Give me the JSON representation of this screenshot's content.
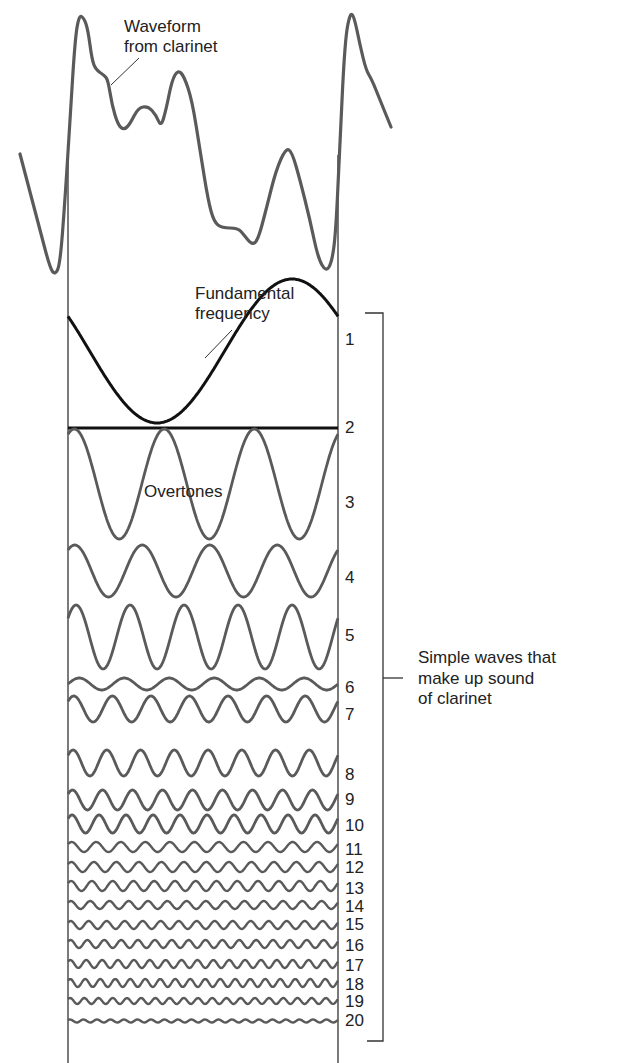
{
  "labels": {
    "waveform": [
      "Waveform",
      "from clarinet"
    ],
    "fundamental": [
      "Fundamental",
      "frequency"
    ],
    "overtones": "Overtones",
    "bracket": [
      "Simple waves that",
      "make up sound",
      "of clarinet"
    ]
  },
  "colors": {
    "wave": "#5a5a5a",
    "fundamental": "#111111",
    "frame": "#333333",
    "text": "#222222"
  },
  "frame": {
    "left_x": 68,
    "right_x": 338,
    "top_y": 155,
    "bottom_y": 1063
  },
  "bracket": {
    "x": 383,
    "top_y": 313,
    "bottom_y": 1041,
    "tick_y": 678
  },
  "waveform_points": [
    [
      20,
      154
    ],
    [
      40,
      230
    ],
    [
      50,
      268
    ],
    [
      55,
      275
    ],
    [
      60,
      265
    ],
    [
      65,
      200
    ],
    [
      70,
      120
    ],
    [
      75,
      40
    ],
    [
      79,
      15
    ],
    [
      84,
      18
    ],
    [
      88,
      30
    ],
    [
      92,
      60
    ],
    [
      96,
      70
    ],
    [
      104,
      75
    ],
    [
      108,
      80
    ],
    [
      112,
      105
    ],
    [
      118,
      125
    ],
    [
      124,
      130
    ],
    [
      130,
      124
    ],
    [
      138,
      108
    ],
    [
      148,
      106
    ],
    [
      156,
      115
    ],
    [
      161,
      127
    ],
    [
      166,
      110
    ],
    [
      172,
      80
    ],
    [
      178,
      70
    ],
    [
      184,
      76
    ],
    [
      192,
      100
    ],
    [
      200,
      150
    ],
    [
      208,
      200
    ],
    [
      214,
      222
    ],
    [
      222,
      228
    ],
    [
      238,
      228
    ],
    [
      244,
      235
    ],
    [
      252,
      245
    ],
    [
      258,
      240
    ],
    [
      266,
      210
    ],
    [
      276,
      170
    ],
    [
      286,
      148
    ],
    [
      292,
      152
    ],
    [
      300,
      180
    ],
    [
      310,
      220
    ],
    [
      318,
      258
    ],
    [
      326,
      272
    ],
    [
      332,
      262
    ],
    [
      336,
      230
    ],
    [
      340,
      140
    ],
    [
      345,
      40
    ],
    [
      350,
      13
    ],
    [
      354,
      16
    ],
    [
      360,
      45
    ],
    [
      366,
      70
    ],
    [
      372,
      80
    ],
    [
      380,
      100
    ],
    [
      391,
      127
    ]
  ],
  "chart_data": {
    "type": "line",
    "xlabel": "",
    "ylabel": "",
    "annotations": [
      "Waveform from clarinet",
      "Fundamental frequency",
      "Overtones",
      "Simple waves that make up sound of clarinet"
    ],
    "harmonics": [
      {
        "n": 1,
        "cycles": 1,
        "center_y": 351,
        "amp": 72,
        "phase": 0.42
      },
      {
        "n": 2,
        "cycles": 0,
        "center_y": 428,
        "amp": 0,
        "phase": 0
      },
      {
        "n": 3,
        "cycles": 3,
        "center_y": 484,
        "amp": 55,
        "phase": 0.18
      },
      {
        "n": 4,
        "cycles": 4,
        "center_y": 571,
        "amp": 26,
        "phase": 0.15
      },
      {
        "n": 5,
        "cycles": 5,
        "center_y": 637,
        "amp": 32,
        "phase": 0.1
      },
      {
        "n": 6,
        "cycles": 6,
        "center_y": 684,
        "amp": 6,
        "phase": 0.0
      },
      {
        "n": 7,
        "cycles": 7,
        "center_y": 709,
        "amp": 13,
        "phase": 0.1
      },
      {
        "n": 8,
        "cycles": 8,
        "center_y": 763,
        "amp": 13,
        "phase": 0.1
      },
      {
        "n": 9,
        "cycles": 9,
        "center_y": 800,
        "amp": 10,
        "phase": 0.1
      },
      {
        "n": 10,
        "cycles": 10,
        "center_y": 824,
        "amp": 9,
        "phase": 0.1
      },
      {
        "n": 11,
        "cycles": 11,
        "center_y": 847,
        "amp": 5,
        "phase": 0.1
      },
      {
        "n": 12,
        "cycles": 12,
        "center_y": 867,
        "amp": 5,
        "phase": 0.1
      },
      {
        "n": 13,
        "cycles": 13,
        "center_y": 886,
        "amp": 5,
        "phase": 0.1
      },
      {
        "n": 14,
        "cycles": 14,
        "center_y": 905,
        "amp": 4,
        "phase": 0.1
      },
      {
        "n": 15,
        "cycles": 15,
        "center_y": 925,
        "amp": 4,
        "phase": 0.1
      },
      {
        "n": 16,
        "cycles": 16,
        "center_y": 944,
        "amp": 4,
        "phase": 0.1
      },
      {
        "n": 17,
        "cycles": 17,
        "center_y": 964,
        "amp": 4,
        "phase": 0.1
      },
      {
        "n": 18,
        "cycles": 18,
        "center_y": 983,
        "amp": 4,
        "phase": 0.1
      },
      {
        "n": 19,
        "cycles": 19,
        "center_y": 1001,
        "amp": 3,
        "phase": 0.1
      },
      {
        "n": 20,
        "cycles": 20,
        "center_y": 1021,
        "amp": 1.5,
        "phase": 0.1
      }
    ],
    "number_labels_y": {
      "1": 340,
      "2": 428,
      "3": 503,
      "4": 578,
      "5": 636,
      "6": 688,
      "7": 715,
      "8": 775,
      "9": 800,
      "10": 826,
      "11": 850,
      "12": 868,
      "13": 889,
      "14": 907,
      "15": 925,
      "16": 946,
      "17": 966,
      "18": 985,
      "19": 1002,
      "20": 1021
    }
  }
}
